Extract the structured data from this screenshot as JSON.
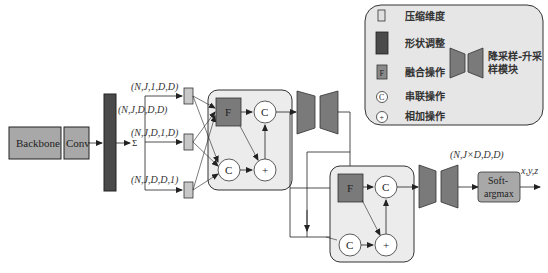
{
  "diagram": {
    "blocks": {
      "backbone": "Backbone",
      "conv": "Conv",
      "softargmax_line1": "Soft-",
      "softargmax_line2": "argmax",
      "fusion": "F",
      "concat": "C",
      "add": "+"
    },
    "labels": {
      "shape_top": "(N,J,1,D,D)",
      "shape_full": "(N,J,D,D,D)",
      "shape_mid": "(N,J,D,1,D)",
      "shape_bot": "(N,J,D,D,1)",
      "sum_symbol": "Σ",
      "shape_output": "(N,J×D,D,D)",
      "output_xyz": "x,y,z"
    },
    "legend": {
      "compress_dim": "压缩维度",
      "reshape": "形状调整",
      "fusion_op": "融合操作",
      "concat_op": "串联操作",
      "add_op": "相加操作",
      "updown_line1": "降采样-升采",
      "updown_line2": "样模块",
      "fusion_glyph": "F",
      "concat_glyph": "C",
      "add_glyph": "+"
    },
    "colors": {
      "dark_block": "#4a4a4a",
      "mid_block": "#8a8a8a",
      "light_block": "#c8c8c8",
      "group_bg": "#ececec",
      "fusion_fill": "#7a7a7a"
    }
  }
}
